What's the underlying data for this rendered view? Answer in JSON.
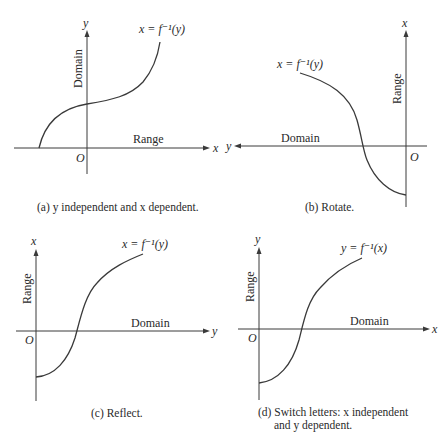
{
  "figure": {
    "panels": [
      {
        "id": "a",
        "curve_label": "x = f⁻¹(y)",
        "vertical_axis_letter": "y",
        "horizontal_axis_letter": "x",
        "vertical_axis_name": "Domain",
        "horizontal_axis_name": "Range",
        "origin": "O",
        "caption": "(a) y independent and x dependent."
      },
      {
        "id": "b",
        "curve_label": "x = f⁻¹(y)",
        "vertical_axis_letter": "x",
        "horizontal_axis_letter": "y",
        "vertical_axis_name": "Range",
        "horizontal_axis_name": "Domain",
        "origin": "O",
        "caption": "(b) Rotate."
      },
      {
        "id": "c",
        "curve_label": "x = f⁻¹(y)",
        "vertical_axis_letter": "x",
        "horizontal_axis_letter": "y",
        "vertical_axis_name": "Range",
        "horizontal_axis_name": "Domain",
        "origin": "O",
        "caption": "(c) Reflect."
      },
      {
        "id": "d",
        "curve_label": "y = f⁻¹(x)",
        "vertical_axis_letter": "y",
        "horizontal_axis_letter": "x",
        "vertical_axis_name": "Range",
        "horizontal_axis_name": "Domain",
        "origin": "O",
        "caption_line1": "(d) Switch letters: x independent",
        "caption_line2": "and y dependent."
      }
    ]
  }
}
